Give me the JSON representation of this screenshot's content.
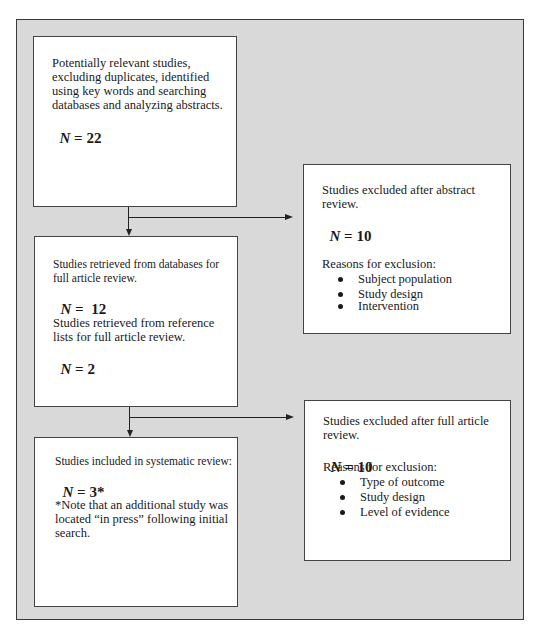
{
  "diagram": {
    "type": "flow-chart",
    "colors": {
      "background_panel": "#d9d9d9",
      "box_fill": "#ffffff",
      "box_border": "#444444",
      "line": "#222222"
    },
    "nodes": [
      {
        "id": "identified",
        "text": "Potentially relevant studies,\nexcluding duplicates, identified\nusing key words and searching\ndatabases and analyzing abstracts.",
        "n_var": "N",
        "n_value": " = 22"
      },
      {
        "id": "retrieved",
        "text_1": "Studies retrieved from databases for\nfull article review.",
        "n1_var": "N",
        "n1_value": " =  12",
        "text_2": "Studies retrieved from reference\nlists for full article review.",
        "n2_var": "N",
        "n2_value": " = 2"
      },
      {
        "id": "included",
        "text": "Studies included in systematic review:",
        "n_var": "N",
        "n_value": " = 3*",
        "note": "*Note that an additional study was\nlocated “in press” following initial\nsearch."
      },
      {
        "id": "excluded_abstract",
        "text": "Studies excluded after abstract\nreview.",
        "n_var": "N",
        "n_value": " = 10",
        "reasons_label": "Reasons for exclusion:",
        "reasons": [
          "Subject population",
          "Study design",
          "Intervention"
        ]
      },
      {
        "id": "excluded_full",
        "text": "Studies excluded after full article\nreview.",
        "n_var": "N",
        "n_value": " = 10",
        "reasons_label": "Reasons for exclusion:",
        "reasons": [
          "Type of outcome",
          "Study design",
          "Level of evidence"
        ]
      }
    ],
    "edges": [
      {
        "from": "identified",
        "to": "retrieved"
      },
      {
        "from": "identified",
        "to": "excluded_abstract"
      },
      {
        "from": "retrieved",
        "to": "included"
      },
      {
        "from": "retrieved",
        "to": "excluded_full"
      }
    ]
  }
}
